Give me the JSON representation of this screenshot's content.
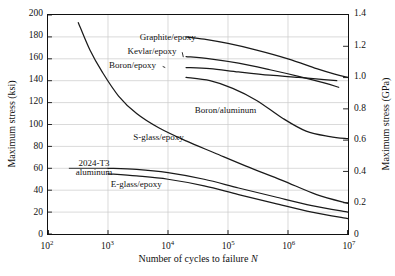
{
  "chart_data": {
    "type": "line",
    "title": "",
    "xlabel": "Number of cycles to failure N",
    "ylabel": "Maximum stress (ksi)",
    "ylabel_right": "Maximum stress (GPa)",
    "xscale": "log",
    "xlim": [
      100,
      10000000
    ],
    "ylim": [
      0,
      200
    ],
    "ylim_right": [
      0,
      1.4
    ],
    "grid": true,
    "legend_position": "inline-annotations",
    "xticks": [
      "10^2",
      "10^3",
      "10^4",
      "10^5",
      "10^6",
      "10^7"
    ],
    "xtick_labels": [
      "10",
      "10",
      "10",
      "10",
      "10",
      "10"
    ],
    "xtick_exponents": [
      "2",
      "3",
      "4",
      "5",
      "6",
      "7"
    ],
    "yticks_left": [
      0,
      20,
      40,
      60,
      80,
      100,
      120,
      140,
      160,
      180,
      200
    ],
    "yticks_right": [
      "0",
      "0.2",
      "0.4",
      "0.6",
      "0.8",
      "1.0",
      "1.2",
      "1.4"
    ],
    "series": [
      {
        "name": "Graphite/epoxy",
        "label": "Graphite/epoxy",
        "label_x": 10000,
        "label_y": 178,
        "x": [
          20000,
          40000,
          100000,
          300000,
          1000000,
          3000000,
          6000000,
          10000000
        ],
        "y": [
          180,
          178,
          174,
          168,
          160,
          151,
          146,
          143
        ]
      },
      {
        "name": "Kevlar/epoxy",
        "label": "Kevlar/epoxy",
        "label_x": 5500,
        "label_y": 166,
        "x": [
          20000,
          50000,
          150000,
          500000,
          1500000,
          4000000,
          7000000
        ],
        "y": [
          162,
          160,
          156,
          150,
          144,
          138,
          134
        ]
      },
      {
        "name": "Boron/epoxy",
        "label": "Boron/epoxy",
        "label_x": 2600,
        "label_y": 153,
        "x": [
          20000,
          50000,
          150000,
          500000,
          1500000,
          4000000,
          6500000
        ],
        "y": [
          152,
          151,
          148,
          145,
          143,
          141,
          140
        ]
      },
      {
        "name": "Boron/aluminum",
        "label": "Boron/aluminum",
        "label_x": 90000,
        "label_y": 112,
        "x": [
          20000,
          50000,
          120000,
          300000,
          800000,
          2000000,
          5000000,
          10000000
        ],
        "y": [
          143,
          140,
          133,
          122,
          106,
          94,
          89,
          87
        ]
      },
      {
        "name": "S-glass/epoxy",
        "label": "S-glass/epoxy",
        "label_x": 7000,
        "label_y": 88,
        "x": [
          320,
          500,
          800,
          1500,
          3000,
          7000,
          20000,
          60000,
          200000,
          800000,
          3000000,
          10000000
        ],
        "y": [
          193,
          168,
          148,
          126,
          110,
          97,
          85,
          74,
          62,
          49,
          36,
          28
        ]
      },
      {
        "name": "2024-T3 aluminum",
        "label": "2024-T3 aluminum",
        "label_x": 600,
        "label_y": 60,
        "x": [
          1000,
          3000,
          10000,
          40000,
          150000,
          600000,
          2500000,
          10000000
        ],
        "y": [
          60,
          59,
          56,
          50,
          42,
          34,
          26,
          20
        ]
      },
      {
        "name": "E-glass/epoxy",
        "label": "E-glass/epoxy",
        "label_x": 3000,
        "label_y": 45,
        "x": [
          1000,
          3000,
          10000,
          40000,
          150000,
          600000,
          2500000,
          10000000
        ],
        "y": [
          55,
          53,
          50,
          44,
          36,
          28,
          20,
          14
        ]
      }
    ]
  },
  "figure": {
    "axis_color": "#111111",
    "grid_color": "#c9c9c9",
    "curve_color": "#1a1a1a",
    "background": "#ffffff"
  }
}
